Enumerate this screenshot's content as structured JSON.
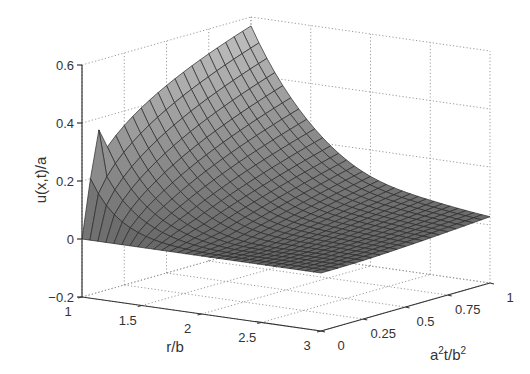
{
  "chart_data": {
    "type": "surface3d",
    "title": "",
    "xlabel": "r/b",
    "ylabel": "a^2t/b^2",
    "zlabel": "u(x,t)/a",
    "x_ticks": [
      "1",
      "1.5",
      "2",
      "2.5",
      "3"
    ],
    "x_tick_values": [
      1,
      1.5,
      2,
      2.5,
      3
    ],
    "y_ticks": [
      "0",
      "0.25",
      "0.5",
      "0.75",
      "1"
    ],
    "y_tick_values": [
      0,
      0.25,
      0.5,
      0.75,
      1
    ],
    "z_ticks": [
      "−0.2",
      "0",
      "0.2",
      "0.4",
      "0.6"
    ],
    "z_tick_values": [
      -0.2,
      0,
      0.2,
      0.4,
      0.6
    ],
    "xlim": [
      1,
      3
    ],
    "ylim": [
      0,
      1
    ],
    "zlim": [
      -0.2,
      0.6
    ],
    "grid": true,
    "colormap": "gray",
    "surface_description": "Function decays from the r/b=1 boundary toward r/b=3; boundary value at r/b=1 rises with a^2t/b^2 to about 0.57 at t=1, with a sharp spike near t≈0.1 (≈0.36); surface approaches 0 for large r/b.",
    "sample_points": [
      {
        "r": 1.0,
        "t": 0.1,
        "u": 0.36
      },
      {
        "r": 1.0,
        "t": 0.5,
        "u": 0.45
      },
      {
        "r": 1.0,
        "t": 1.0,
        "u": 0.57
      },
      {
        "r": 2.0,
        "t": 1.0,
        "u": 0.15
      },
      {
        "r": 3.0,
        "t": 1.0,
        "u": 0.0
      },
      {
        "r": 3.0,
        "t": 0.0,
        "u": 0.0
      }
    ]
  },
  "axes": {
    "x_label": "r/b",
    "y_label_base": "a",
    "y_label_sup1": "2",
    "y_label_mid": "t/b",
    "y_label_sup2": "2",
    "z_label": "u(x,t)/a"
  }
}
